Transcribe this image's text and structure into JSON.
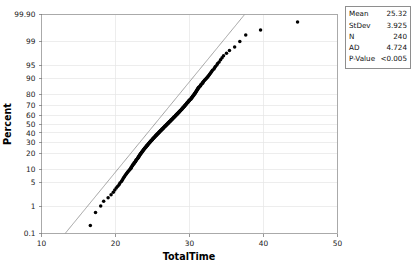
{
  "chart_data": {
    "type": "scatter",
    "plot_kind": "normal-probability-plot",
    "title": "",
    "xlabel": "TotalTime",
    "ylabel": "Percent",
    "xlim": [
      10,
      50
    ],
    "ylim": [
      0.1,
      99.9
    ],
    "xticks": [
      10,
      20,
      30,
      40,
      50
    ],
    "xtick_labels": [
      "10",
      "20",
      "30",
      "40",
      "50"
    ],
    "yticks": [
      0.1,
      1,
      5,
      10,
      20,
      30,
      40,
      50,
      60,
      70,
      80,
      90,
      95,
      99,
      99.9
    ],
    "ytick_labels": [
      "0.1",
      "1",
      "5",
      "10",
      "20",
      "30",
      "40",
      "50",
      "60",
      "70",
      "80",
      "90",
      "95",
      "99",
      "99.90"
    ],
    "grid": true,
    "legend_position": "top-right-outside",
    "yscale": "normal-probability",
    "reference_line": {
      "label": "fitted normal line",
      "mean": 25.32,
      "stdev": 3.925,
      "color": "#8c8c8c"
    },
    "series": [
      {
        "name": "TotalTime",
        "marker": "filled-circle",
        "color": "#000000",
        "points": [
          [
            16.6,
            0.21
          ],
          [
            17.3,
            0.62
          ],
          [
            18.0,
            1.04
          ],
          [
            18.4,
            1.46
          ],
          [
            19.0,
            1.87
          ],
          [
            19.4,
            2.29
          ],
          [
            19.7,
            2.71
          ],
          [
            19.9,
            3.12
          ],
          [
            20.1,
            3.54
          ],
          [
            20.3,
            3.96
          ],
          [
            20.5,
            4.37
          ],
          [
            20.6,
            4.79
          ],
          [
            20.8,
            5.21
          ],
          [
            20.9,
            5.62
          ],
          [
            21.0,
            6.04
          ],
          [
            21.1,
            6.46
          ],
          [
            21.2,
            6.87
          ],
          [
            21.3,
            7.29
          ],
          [
            21.4,
            7.71
          ],
          [
            21.5,
            8.12
          ],
          [
            21.6,
            8.54
          ],
          [
            21.7,
            8.96
          ],
          [
            21.8,
            9.37
          ],
          [
            21.9,
            9.79
          ],
          [
            22.0,
            10.2
          ],
          [
            22.1,
            10.6
          ],
          [
            22.1,
            11.0
          ],
          [
            22.2,
            11.5
          ],
          [
            22.3,
            11.9
          ],
          [
            22.3,
            12.3
          ],
          [
            22.4,
            12.7
          ],
          [
            22.5,
            13.1
          ],
          [
            22.5,
            13.5
          ],
          [
            22.6,
            14.0
          ],
          [
            22.7,
            14.4
          ],
          [
            22.7,
            14.8
          ],
          [
            22.8,
            15.2
          ],
          [
            22.8,
            15.6
          ],
          [
            22.9,
            16.0
          ],
          [
            23.0,
            16.5
          ],
          [
            23.0,
            16.9
          ],
          [
            23.1,
            17.3
          ],
          [
            23.1,
            17.7
          ],
          [
            23.2,
            18.1
          ],
          [
            23.2,
            18.5
          ],
          [
            23.3,
            19.0
          ],
          [
            23.3,
            19.4
          ],
          [
            23.4,
            19.8
          ],
          [
            23.4,
            20.2
          ],
          [
            23.5,
            20.6
          ],
          [
            23.5,
            21.0
          ],
          [
            23.6,
            21.5
          ],
          [
            23.6,
            21.9
          ],
          [
            23.7,
            22.3
          ],
          [
            23.7,
            22.7
          ],
          [
            23.8,
            23.1
          ],
          [
            23.8,
            23.5
          ],
          [
            23.9,
            24.0
          ],
          [
            23.9,
            24.4
          ],
          [
            24.0,
            24.8
          ],
          [
            24.0,
            25.2
          ],
          [
            24.1,
            25.6
          ],
          [
            24.1,
            26.0
          ],
          [
            24.2,
            26.5
          ],
          [
            24.2,
            26.9
          ],
          [
            24.3,
            27.3
          ],
          [
            24.3,
            27.7
          ],
          [
            24.4,
            28.1
          ],
          [
            24.4,
            28.5
          ],
          [
            24.5,
            29.0
          ],
          [
            24.5,
            29.4
          ],
          [
            24.6,
            29.8
          ],
          [
            24.6,
            30.2
          ],
          [
            24.7,
            30.6
          ],
          [
            24.7,
            31.0
          ],
          [
            24.8,
            31.5
          ],
          [
            24.8,
            31.9
          ],
          [
            24.9,
            32.3
          ],
          [
            24.9,
            32.7
          ],
          [
            25.0,
            33.1
          ],
          [
            25.0,
            33.5
          ],
          [
            25.1,
            34.0
          ],
          [
            25.1,
            34.4
          ],
          [
            25.2,
            34.8
          ],
          [
            25.2,
            35.2
          ],
          [
            25.3,
            35.6
          ],
          [
            25.3,
            36.0
          ],
          [
            25.4,
            36.5
          ],
          [
            25.4,
            36.9
          ],
          [
            25.5,
            37.3
          ],
          [
            25.5,
            37.7
          ],
          [
            25.6,
            38.1
          ],
          [
            25.6,
            38.5
          ],
          [
            25.7,
            39.0
          ],
          [
            25.7,
            39.4
          ],
          [
            25.8,
            39.8
          ],
          [
            25.8,
            40.2
          ],
          [
            25.9,
            40.6
          ],
          [
            25.9,
            41.0
          ],
          [
            26.0,
            41.5
          ],
          [
            26.0,
            41.9
          ],
          [
            26.1,
            42.3
          ],
          [
            26.1,
            42.7
          ],
          [
            26.2,
            43.1
          ],
          [
            26.2,
            43.5
          ],
          [
            26.3,
            44.0
          ],
          [
            26.3,
            44.4
          ],
          [
            26.4,
            44.8
          ],
          [
            26.4,
            45.2
          ],
          [
            26.5,
            45.6
          ],
          [
            26.5,
            46.0
          ],
          [
            26.6,
            46.5
          ],
          [
            26.6,
            46.9
          ],
          [
            26.7,
            47.3
          ],
          [
            26.7,
            47.7
          ],
          [
            26.8,
            48.1
          ],
          [
            26.8,
            48.5
          ],
          [
            26.9,
            49.0
          ],
          [
            26.9,
            49.4
          ],
          [
            27.0,
            49.8
          ],
          [
            27.0,
            50.2
          ],
          [
            27.1,
            50.6
          ],
          [
            27.1,
            51.0
          ],
          [
            27.2,
            51.5
          ],
          [
            27.2,
            51.9
          ],
          [
            27.3,
            52.3
          ],
          [
            27.3,
            52.7
          ],
          [
            27.4,
            53.1
          ],
          [
            27.4,
            53.5
          ],
          [
            27.5,
            54.0
          ],
          [
            27.5,
            54.4
          ],
          [
            27.6,
            54.8
          ],
          [
            27.6,
            55.2
          ],
          [
            27.7,
            55.6
          ],
          [
            27.7,
            56.0
          ],
          [
            27.8,
            56.5
          ],
          [
            27.8,
            56.9
          ],
          [
            27.9,
            57.3
          ],
          [
            27.9,
            57.7
          ],
          [
            28.0,
            58.1
          ],
          [
            28.0,
            58.5
          ],
          [
            28.1,
            59.0
          ],
          [
            28.1,
            59.4
          ],
          [
            28.2,
            59.8
          ],
          [
            28.2,
            60.2
          ],
          [
            28.3,
            60.6
          ],
          [
            28.3,
            61.0
          ],
          [
            28.4,
            61.5
          ],
          [
            28.4,
            61.9
          ],
          [
            28.5,
            62.3
          ],
          [
            28.5,
            62.7
          ],
          [
            28.6,
            63.1
          ],
          [
            28.6,
            63.5
          ],
          [
            28.7,
            64.0
          ],
          [
            28.7,
            64.4
          ],
          [
            28.8,
            64.8
          ],
          [
            28.8,
            65.2
          ],
          [
            28.9,
            65.6
          ],
          [
            28.9,
            66.0
          ],
          [
            29.0,
            66.5
          ],
          [
            29.0,
            66.9
          ],
          [
            29.1,
            67.3
          ],
          [
            29.1,
            67.7
          ],
          [
            29.2,
            68.1
          ],
          [
            29.2,
            68.5
          ],
          [
            29.3,
            69.0
          ],
          [
            29.3,
            69.4
          ],
          [
            29.4,
            69.8
          ],
          [
            29.4,
            70.2
          ],
          [
            29.5,
            70.6
          ],
          [
            29.5,
            71.0
          ],
          [
            29.6,
            71.5
          ],
          [
            29.6,
            71.9
          ],
          [
            29.7,
            72.3
          ],
          [
            29.7,
            72.7
          ],
          [
            29.8,
            73.1
          ],
          [
            29.8,
            73.5
          ],
          [
            29.9,
            74.0
          ],
          [
            29.9,
            74.4
          ],
          [
            30.0,
            74.8
          ],
          [
            30.0,
            75.2
          ],
          [
            30.1,
            75.6
          ],
          [
            30.2,
            76.0
          ],
          [
            30.2,
            76.5
          ],
          [
            30.3,
            76.9
          ],
          [
            30.3,
            77.3
          ],
          [
            30.4,
            77.7
          ],
          [
            30.4,
            78.1
          ],
          [
            30.5,
            78.5
          ],
          [
            30.5,
            79.0
          ],
          [
            30.6,
            79.4
          ],
          [
            30.6,
            79.8
          ],
          [
            30.7,
            80.2
          ],
          [
            30.7,
            80.6
          ],
          [
            30.8,
            81.0
          ],
          [
            30.8,
            81.5
          ],
          [
            30.9,
            81.9
          ],
          [
            30.9,
            82.3
          ],
          [
            31.0,
            82.7
          ],
          [
            31.0,
            83.1
          ],
          [
            31.1,
            83.5
          ],
          [
            31.1,
            84.0
          ],
          [
            31.2,
            84.4
          ],
          [
            31.2,
            84.8
          ],
          [
            31.3,
            85.2
          ],
          [
            31.4,
            85.6
          ],
          [
            31.5,
            86.0
          ],
          [
            31.5,
            86.5
          ],
          [
            31.6,
            86.9
          ],
          [
            31.7,
            87.3
          ],
          [
            31.8,
            87.7
          ],
          [
            31.8,
            88.1
          ],
          [
            31.9,
            88.5
          ],
          [
            32.0,
            89.0
          ],
          [
            32.1,
            89.4
          ],
          [
            32.2,
            89.8
          ],
          [
            32.3,
            90.2
          ],
          [
            32.4,
            90.6
          ],
          [
            32.5,
            91.0
          ],
          [
            32.6,
            91.5
          ],
          [
            32.7,
            91.9
          ],
          [
            32.8,
            92.3
          ],
          [
            32.9,
            92.7
          ],
          [
            33.0,
            93.1
          ],
          [
            33.1,
            93.5
          ],
          [
            33.3,
            94.0
          ],
          [
            33.4,
            94.4
          ],
          [
            33.5,
            94.8
          ],
          [
            33.7,
            95.2
          ],
          [
            33.8,
            95.6
          ],
          [
            34.0,
            96.0
          ],
          [
            34.2,
            96.5
          ],
          [
            34.4,
            96.9
          ],
          [
            34.6,
            97.3
          ],
          [
            35.0,
            97.7
          ],
          [
            35.4,
            98.1
          ],
          [
            36.1,
            98.5
          ],
          [
            36.8,
            99.0
          ],
          [
            37.6,
            99.4
          ],
          [
            39.6,
            99.6
          ],
          [
            44.6,
            99.8
          ]
        ]
      }
    ],
    "statistics": {
      "rows": [
        {
          "key": "Mean",
          "value": "25.32"
        },
        {
          "key": "StDev",
          "value": "3.925"
        },
        {
          "key": "N",
          "value": "240"
        },
        {
          "key": "AD",
          "value": "4.724"
        },
        {
          "key": "P-Value",
          "value": "<0.005"
        }
      ]
    }
  }
}
